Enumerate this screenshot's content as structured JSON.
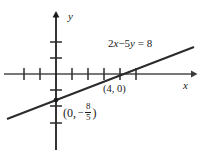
{
  "figure": {
    "kind": "coordinate-plane-line-graph",
    "background": "#ffffff",
    "stroke_color": "#2b2b2b",
    "text_color": "#1a1a1a"
  },
  "axes": {
    "x_label": "x",
    "y_label": "y",
    "origin_px": {
      "x": 56,
      "y": 74
    },
    "unit_px": 16,
    "x_axis": {
      "start_px": 4,
      "end_px": 196,
      "arrow": "right"
    },
    "y_axis": {
      "start_px": 150,
      "end_px": 12,
      "arrow": "up"
    },
    "x_ticks_px": [
      24,
      40,
      72,
      88,
      104,
      120,
      136
    ],
    "y_ticks_px": [
      42,
      58,
      90,
      106,
      123
    ]
  },
  "line": {
    "equation_label": "2x − 5y = 8",
    "equation_parts": {
      "coef_x": "2",
      "var_x": "x",
      "minus": "−",
      "coef_y": "5",
      "var_y": "y",
      "equals": "=",
      "rhs": "8"
    },
    "start_px": {
      "x": 7,
      "y": 119
    },
    "end_px": {
      "x": 194,
      "y": 47
    }
  },
  "points": [
    {
      "name": "x-intercept",
      "label": "(4, 0)",
      "value": {
        "x": 4,
        "y": 0
      },
      "px": {
        "x": 120,
        "y": 74
      },
      "marker": "tick-cross"
    },
    {
      "name": "y-intercept",
      "label_prefix": "(0,",
      "label_minus": "−",
      "numerator": "8",
      "denominator": "5",
      "label_suffix": ")",
      "value": {
        "x": 0,
        "y": -1.6
      },
      "px": {
        "x": 56,
        "y": 100
      },
      "marker": "dot"
    }
  ]
}
